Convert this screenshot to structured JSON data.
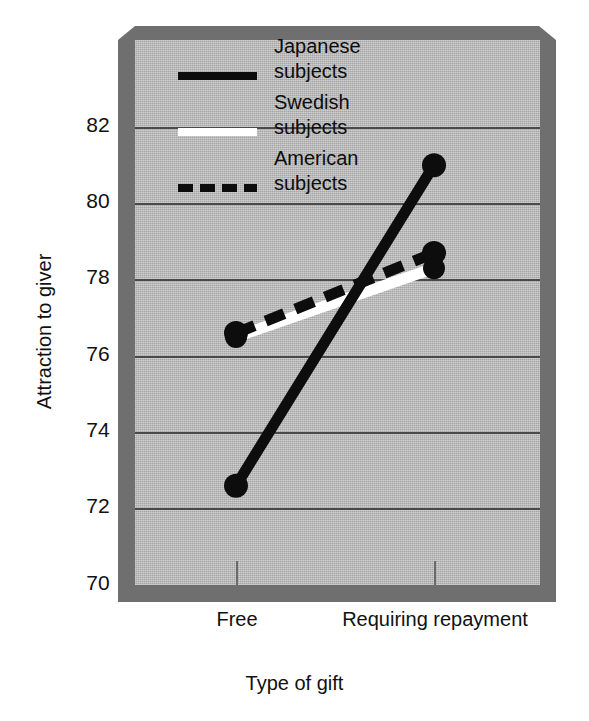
{
  "chart_data": {
    "type": "line",
    "title": "",
    "xlabel": "Type of gift",
    "ylabel": "Attraction to giver",
    "categories": [
      "Free",
      "Requiring\nrepayment"
    ],
    "ylim": [
      70,
      82.8
    ],
    "yticks": [
      70,
      72,
      74,
      76,
      78,
      80,
      82
    ],
    "ytick_labels": [
      "70",
      "72",
      "74",
      "76",
      "78",
      "80",
      "82"
    ],
    "grid": true,
    "legend_position": "upper-left-inside",
    "series": [
      {
        "name": "Japanese\nsubjects",
        "style": "solid",
        "color": "#0d0d0d",
        "values": [
          72.6,
          81.0
        ]
      },
      {
        "name": "Swedish\nsubjects",
        "style": "solid",
        "color": "#ffffff",
        "values": [
          76.5,
          78.3
        ]
      },
      {
        "name": "American\nsubjects",
        "style": "dashed",
        "color": "#0d0d0d",
        "values": [
          76.6,
          78.7
        ]
      }
    ]
  },
  "axes": {
    "y_title": "Attraction to giver",
    "x_title": "Type of gift",
    "y_ticks": [
      "82",
      "80",
      "78",
      "76",
      "74",
      "72",
      "70"
    ],
    "x_ticks": [
      "Free",
      "Requiring\nrepayment"
    ]
  },
  "legend": {
    "entries": [
      {
        "label": "Japanese\nsubjects",
        "swatch": "solid-black"
      },
      {
        "label": "Swedish\nsubjects",
        "swatch": "solid-white"
      },
      {
        "label": "American\nsubjects",
        "swatch": "dashed-black"
      }
    ]
  },
  "colors": {
    "plot_face": "#b6b6b6",
    "block_shadow": "#6f6f6f",
    "gridline": "#4a4a4a",
    "ink": "#0d0d0d",
    "white_series": "#ffffff"
  }
}
